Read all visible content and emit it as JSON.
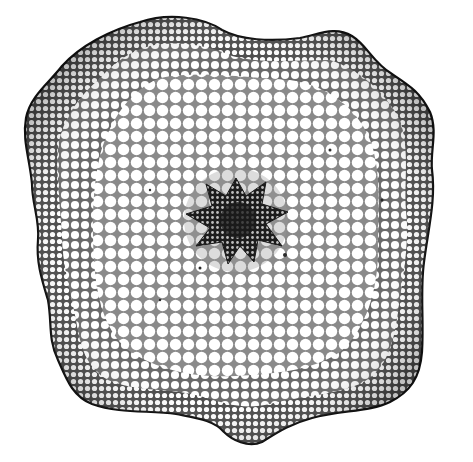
{
  "figure": {
    "style": "monochrome-engraving",
    "background_color": "#ffffff",
    "ink_color": "#1a1a1a",
    "regions": [
      {
        "name": "epidermis-outline",
        "color": "#111111"
      },
      {
        "name": "outer-cortex-dense-cells",
        "color": "#3a3a3a"
      },
      {
        "name": "inner-cortex-large-cells",
        "color": "#f4f4f4"
      },
      {
        "name": "central-stele",
        "color": "#2a2a2a"
      }
    ],
    "stele_arms": 7
  }
}
